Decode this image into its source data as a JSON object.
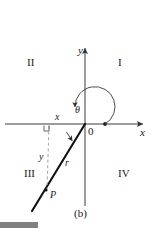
{
  "figure": {
    "caption": "(b)",
    "axes": {
      "x_label": "x",
      "y_label": "y",
      "origin_label": "0"
    },
    "quadrants": {
      "q1": "I",
      "q2": "II",
      "q3": "III",
      "q4": "IV"
    },
    "annotations": {
      "angle": "θ",
      "radius": "r",
      "x_component": "x",
      "y_component": "y",
      "point": "P"
    },
    "colors": {
      "ink": "#1a1a1a",
      "axis": "#444444",
      "ray": "#111111",
      "dashed": "#999999",
      "bar": "#808080",
      "background": "#ffffff"
    },
    "geometry": {
      "origin_px": [
        85,
        124
      ],
      "x_axis_span_px": [
        5,
        146
      ],
      "y_axis_span_px": [
        45,
        206
      ],
      "point_p_px": [
        46,
        190
      ],
      "ray_end_px": [
        32,
        211
      ],
      "arc_radius_px": 20,
      "arc_start_deg": 0,
      "arc_end_deg": 240,
      "angle_theta_deg": 240,
      "dot_on_x_axis_px": [
        105,
        124
      ]
    }
  }
}
